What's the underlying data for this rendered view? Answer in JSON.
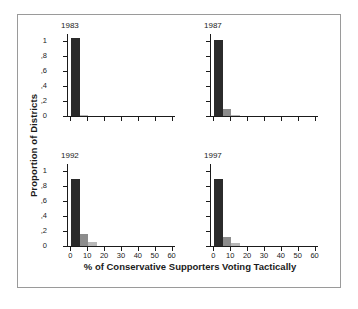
{
  "figure": {
    "xlabel": "% of Conservative Supporters Voting Tactically",
    "ylabel": "Proportion of Districts",
    "frame_color": "#9a9a9a",
    "background": "#ffffff"
  },
  "chart_data": {
    "type": "bar",
    "title": "",
    "xlabel": "% of Conservative Supporters Voting Tactically",
    "ylabel": "Proportion of Districts",
    "xlim": [
      -2,
      62
    ],
    "ylim": [
      0,
      1.1
    ],
    "grid": false,
    "legend": "none",
    "layout": "2x2 small-multiples histogram",
    "xticks": [
      0,
      10,
      20,
      30,
      40,
      50,
      60
    ],
    "xticklabels": [
      "0",
      "10",
      "20",
      "30",
      "40",
      "50",
      "60"
    ],
    "yticks": [
      0,
      0.2,
      0.4,
      0.6,
      0.8,
      1.0
    ],
    "yticklabels": [
      "0",
      ",2",
      ",4",
      ",6",
      ",8",
      "1"
    ],
    "bin_width": 5,
    "colors": {
      "primary_bar": "#2b2b2b",
      "secondary_bar": "#8c8c8c",
      "tertiary_bar": "#b8b8b8",
      "axis": "#1b1b1b"
    },
    "panels": [
      {
        "title": "1983",
        "position": "top-left",
        "show_yticklabels": true,
        "show_xticklabels": false,
        "bins": [
          {
            "x": 0,
            "value": 1.05,
            "shade": "primary"
          },
          {
            "x": 5,
            "value": 0.02,
            "shade": "tertiary"
          }
        ]
      },
      {
        "title": "1987",
        "position": "top-right",
        "show_yticklabels": false,
        "show_xticklabels": false,
        "bins": [
          {
            "x": 0,
            "value": 1.02,
            "shade": "primary"
          },
          {
            "x": 5,
            "value": 0.09,
            "shade": "secondary"
          },
          {
            "x": 10,
            "value": 0.02,
            "shade": "tertiary"
          }
        ]
      },
      {
        "title": "1992",
        "position": "bottom-left",
        "show_yticklabels": true,
        "show_xticklabels": true,
        "bins": [
          {
            "x": 0,
            "value": 0.9,
            "shade": "primary"
          },
          {
            "x": 5,
            "value": 0.16,
            "shade": "secondary"
          },
          {
            "x": 10,
            "value": 0.06,
            "shade": "tertiary"
          }
        ]
      },
      {
        "title": "1997",
        "position": "bottom-right",
        "show_yticklabels": false,
        "show_xticklabels": true,
        "bins": [
          {
            "x": 0,
            "value": 0.9,
            "shade": "primary"
          },
          {
            "x": 5,
            "value": 0.12,
            "shade": "secondary"
          },
          {
            "x": 10,
            "value": 0.04,
            "shade": "tertiary"
          }
        ]
      }
    ]
  }
}
